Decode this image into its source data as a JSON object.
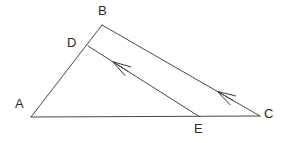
{
  "figure": {
    "type": "geometry-diagram",
    "canvas": {
      "width": 284,
      "height": 143,
      "background": "#ffffff"
    },
    "style": {
      "line_color": "#4a4a4a",
      "line_width": 1,
      "label_color": "#2b2b2b",
      "label_font_size": 13
    },
    "points": [
      {
        "name": "A",
        "x": 31,
        "y": 117,
        "label": "A",
        "label_x": 15,
        "label_y": 97
      },
      {
        "name": "B",
        "x": 102,
        "y": 25,
        "label": "B",
        "label_x": 98,
        "label_y": 4
      },
      {
        "name": "C",
        "x": 260,
        "y": 116,
        "label": "C",
        "label_x": 264,
        "label_y": 107
      },
      {
        "name": "D",
        "x": 88,
        "y": 46,
        "label": "D",
        "label_x": 67,
        "label_y": 36
      },
      {
        "name": "E",
        "x": 200,
        "y": 117,
        "label": "E",
        "label_x": 194,
        "label_y": 122
      }
    ],
    "segments": [
      {
        "name": "AB",
        "from": "A",
        "to": "B",
        "arrow": "none"
      },
      {
        "name": "AC",
        "from": "A",
        "to": "C",
        "arrow": "none"
      },
      {
        "name": "BC",
        "from": "C",
        "to": "B",
        "arrow": "single-left",
        "arrow_at_fraction": 0.27
      },
      {
        "name": "DE",
        "from": "E",
        "to": "D",
        "arrow": "single-left",
        "arrow_at_fraction": 0.78
      }
    ],
    "labels": {
      "A": "A",
      "B": "B",
      "C": "C",
      "D": "D",
      "E": "E"
    }
  }
}
